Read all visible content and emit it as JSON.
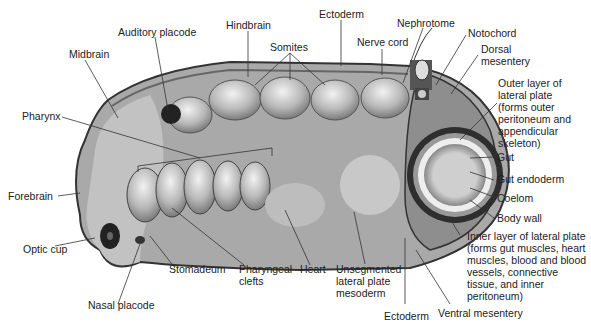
{
  "diagram": {
    "labels": {
      "midbrain": "Midbrain",
      "auditory_placode": "Auditory placode",
      "hindbrain": "Hindbrain",
      "somites": "Somites",
      "ectoderm_top": "Ectoderm",
      "nephrotome": "Nephrotome",
      "nerve_cord": "Nerve cord",
      "notochord": "Notochord",
      "dorsal_mesentery": "Dorsal mesentery",
      "outer_layer": "Outer layer of lateral plate (forms outer peritoneum and appendicular skeleton)",
      "pharynx": "Pharynx",
      "gut": "Gut",
      "gut_endoderm": "Gut endoderm",
      "coelom": "Coelom",
      "body_wall": "Body wall",
      "forebrain": "Forebrain",
      "inner_layer": "Inner layer of lateral plate (forms gut muscles, heart muscles, blood and blood vessels, connective tissue, and inner peritoneum)",
      "optic_cup": "Optic cup",
      "stomadeum": "Stomadeum",
      "pharyngeal_clefts": "Pharyngeal clefts",
      "heart": "Heart",
      "unsegmented": "Unsegmented lateral plate mesoderm",
      "nasal_placode": "Nasal placode",
      "ectoderm_bottom": "Ectoderm",
      "ventral_mesentery": "Ventral mesentery"
    }
  }
}
